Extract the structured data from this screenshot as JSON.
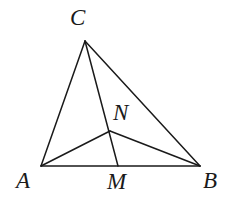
{
  "figure": {
    "kind": "euclidean-geometry-diagram",
    "background_color": "#ffffff",
    "stroke_color": "#1a1a1a",
    "stroke_width": 1.5,
    "label_color": "#1a1a1a",
    "label_style": "italic-serif",
    "label_font_size": 23,
    "width": 237,
    "height": 215
  },
  "points": {
    "A": {
      "label": "A",
      "x": 41,
      "y": 166,
      "label_x": 16,
      "label_y": 169
    },
    "B": {
      "label": "B",
      "x": 200,
      "y": 166,
      "label_x": 203,
      "label_y": 169
    },
    "C": {
      "label": "C",
      "x": 85,
      "y": 41,
      "label_x": 70,
      "label_y": 6
    },
    "M": {
      "label": "M",
      "x": 118,
      "y": 166,
      "label_x": 107,
      "label_y": 170
    },
    "N": {
      "label": "N",
      "x": 110,
      "y": 131,
      "label_x": 113,
      "label_y": 101
    }
  },
  "segments": [
    {
      "name": "AB",
      "from": "A",
      "to": "B",
      "x1": 41,
      "y1": 166,
      "x2": 200,
      "y2": 166
    },
    {
      "name": "AC",
      "from": "A",
      "to": "C",
      "x1": 41,
      "y1": 166,
      "x2": 85,
      "y2": 41
    },
    {
      "name": "CB",
      "from": "C",
      "to": "B",
      "x1": 85,
      "y1": 41,
      "x2": 200,
      "y2": 166
    },
    {
      "name": "CM",
      "from": "C",
      "to": "M",
      "x1": 85,
      "y1": 41,
      "x2": 118,
      "y2": 166
    },
    {
      "name": "AN",
      "from": "A",
      "to": "N",
      "x1": 41,
      "y1": 166,
      "x2": 110,
      "y2": 131
    },
    {
      "name": "NB",
      "from": "N",
      "to": "B",
      "x1": 110,
      "y1": 131,
      "x2": 200,
      "y2": 166
    }
  ]
}
